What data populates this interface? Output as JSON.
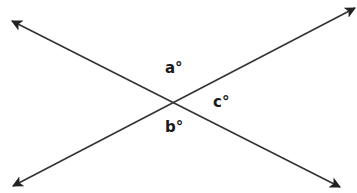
{
  "diagram": {
    "type": "intersecting-lines",
    "line_color": "#333333",
    "lines": [
      {
        "name": "line-1",
        "from": [
          12,
          21
        ],
        "to": [
          340,
          187
        ]
      },
      {
        "name": "line-2",
        "from": [
          13,
          186
        ],
        "to": [
          355,
          8
        ]
      }
    ],
    "intersection": [
      172,
      102
    ],
    "labels": [
      {
        "name": "angle-a",
        "text": "a°",
        "x": 165,
        "y": 73
      },
      {
        "name": "angle-c",
        "text": "c°",
        "x": 213,
        "y": 107
      },
      {
        "name": "angle-b",
        "text": "b°",
        "x": 165,
        "y": 132
      }
    ]
  }
}
